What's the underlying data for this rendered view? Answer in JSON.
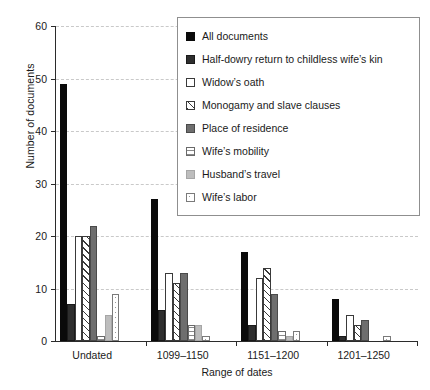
{
  "chart_data": {
    "type": "bar",
    "title": "",
    "xlabel": "Range of dates",
    "ylabel": "Number of documents",
    "categories": [
      "Undated",
      "1099–1150",
      "1151–1200",
      "1201–1250"
    ],
    "ylim": [
      0,
      60
    ],
    "yticks": [
      0,
      10,
      20,
      30,
      40,
      50,
      60
    ],
    "grid": "horizontal-dashed",
    "legend_position": "top-right-inside",
    "series": [
      {
        "name": "All documents",
        "pattern": "solid-black",
        "color": "#0a0a0a",
        "values": [
          49,
          27,
          17,
          8
        ]
      },
      {
        "name": "Half-dowry return to childless wife’s kin",
        "pattern": "solid-dark-gray",
        "color": "#2e2e2e",
        "values": [
          7,
          6,
          3,
          1
        ]
      },
      {
        "name": "Widow’s oath",
        "pattern": "white-outline",
        "color": "#ffffff",
        "values": [
          20,
          13,
          12,
          5
        ]
      },
      {
        "name": "Monogamy and slave clauses",
        "pattern": "diagonal-hatch",
        "color": "#ffffff",
        "values": [
          20,
          11,
          14,
          3
        ]
      },
      {
        "name": "Place of residence",
        "pattern": "solid-medium-gray",
        "color": "#6e6e6e",
        "values": [
          22,
          13,
          9,
          4
        ]
      },
      {
        "name": "Wife’s mobility",
        "pattern": "horizontal-lines",
        "color": "#ffffff",
        "values": [
          1,
          3,
          2,
          0
        ]
      },
      {
        "name": "Husband’s travel",
        "pattern": "solid-light-gray",
        "color": "#bdbdbd",
        "values": [
          5,
          3,
          1,
          0
        ]
      },
      {
        "name": "Wife’s labor",
        "pattern": "dotted",
        "color": "#ffffff",
        "values": [
          9,
          1,
          2,
          1
        ]
      }
    ]
  }
}
